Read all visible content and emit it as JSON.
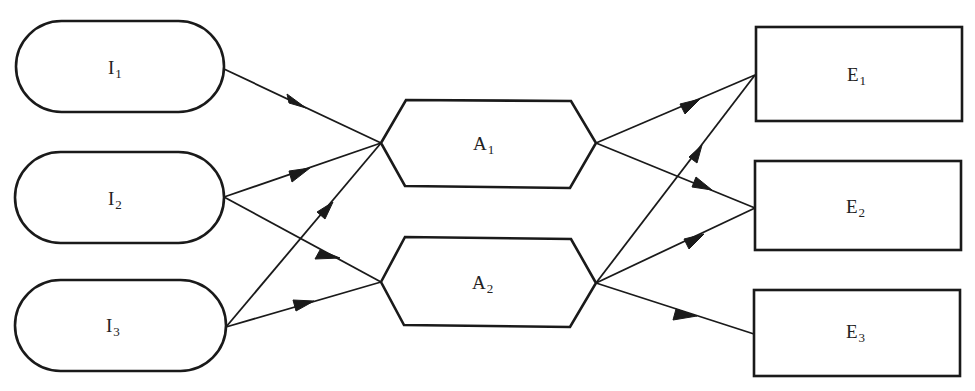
{
  "diagram": {
    "type": "flow-network",
    "colors": {
      "stroke": "#1a1a1a",
      "fill": "#ffffff",
      "text": "#222222"
    },
    "columns": [
      {
        "name": "inputs",
        "shape": "stadium",
        "ids": [
          "I1",
          "I2",
          "I3"
        ]
      },
      {
        "name": "activities",
        "shape": "hexagon",
        "ids": [
          "A1",
          "A2"
        ]
      },
      {
        "name": "outputs",
        "shape": "rectangle",
        "ids": [
          "E1",
          "E2",
          "E3"
        ]
      }
    ],
    "nodes": {
      "I1": {
        "letter": "I",
        "sub": "1",
        "shape": "stadium"
      },
      "I2": {
        "letter": "I",
        "sub": "2",
        "shape": "stadium"
      },
      "I3": {
        "letter": "I",
        "sub": "3",
        "shape": "stadium"
      },
      "A1": {
        "letter": "A",
        "sub": "1",
        "shape": "hexagon"
      },
      "A2": {
        "letter": "A",
        "sub": "2",
        "shape": "hexagon"
      },
      "E1": {
        "letter": "E",
        "sub": "1",
        "shape": "rectangle"
      },
      "E2": {
        "letter": "E",
        "sub": "2",
        "shape": "rectangle"
      },
      "E3": {
        "letter": "E",
        "sub": "3",
        "shape": "rectangle"
      }
    },
    "edges": [
      {
        "from": "I1",
        "to": "A1"
      },
      {
        "from": "I2",
        "to": "A1"
      },
      {
        "from": "I2",
        "to": "A2"
      },
      {
        "from": "I3",
        "to": "A1"
      },
      {
        "from": "I3",
        "to": "A2"
      },
      {
        "from": "A1",
        "to": "E1"
      },
      {
        "from": "A1",
        "to": "E2"
      },
      {
        "from": "A2",
        "to": "E1"
      },
      {
        "from": "A2",
        "to": "E2"
      },
      {
        "from": "A2",
        "to": "E3"
      }
    ]
  }
}
